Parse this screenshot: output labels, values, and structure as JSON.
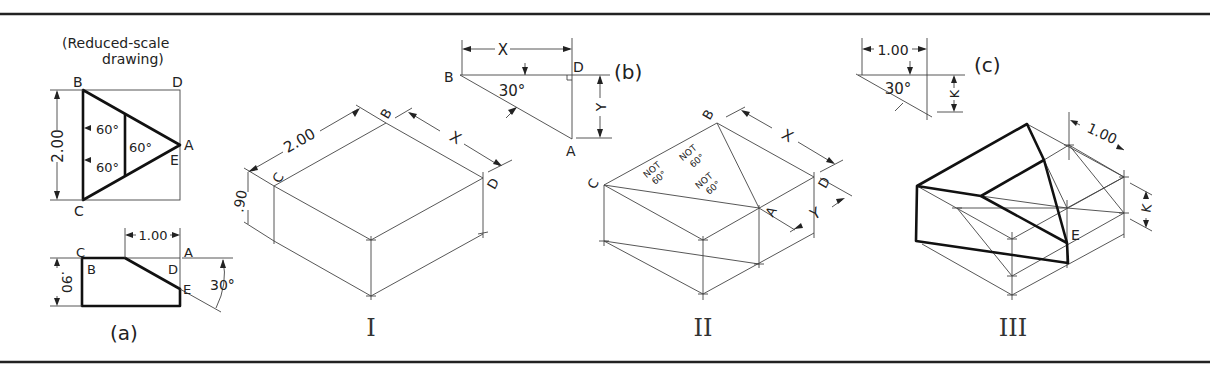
{
  "figure": {
    "panel_a": {
      "caption": "(a)",
      "note_line1": "(Reduced-scale",
      "note_line2": "drawing)",
      "top_view_labels": {
        "B": "B",
        "D": "D",
        "A": "A",
        "E": "E",
        "C": "C"
      },
      "angle_labels": [
        "60°",
        "60°",
        "60°"
      ],
      "height_dim": "2.00",
      "side_view_labels": {
        "C": "C",
        "A": "A",
        "B": "B",
        "D": "D",
        "E": "E"
      },
      "width_dim": "1.00",
      "depth_dim": ".90",
      "bevel_angle": "30°"
    },
    "panel_b": {
      "caption": "(b)",
      "labels": {
        "B": "B",
        "D": "D",
        "A": "A"
      },
      "x_dim": "X",
      "y_dim": "Y",
      "angle": "30°"
    },
    "panel_c": {
      "caption": "(c)",
      "width_dim": "1.00",
      "k_dim": "K",
      "angle": "30°"
    },
    "fig_I": {
      "caption": "I",
      "labels": {
        "B": "B",
        "C": "C",
        "D": "D"
      },
      "length_dim": "2.00",
      "height_dim": ".90",
      "x_dim": "X"
    },
    "fig_II": {
      "caption": "II",
      "labels": {
        "B": "B",
        "C": "C",
        "D": "D",
        "A": "A"
      },
      "not60": [
        "NOT",
        "60°"
      ],
      "x_dim": "X",
      "y_dim": "Y"
    },
    "fig_III": {
      "caption": "III",
      "label_E": "E",
      "width_dim": "1.00",
      "k_dim": "K"
    }
  }
}
